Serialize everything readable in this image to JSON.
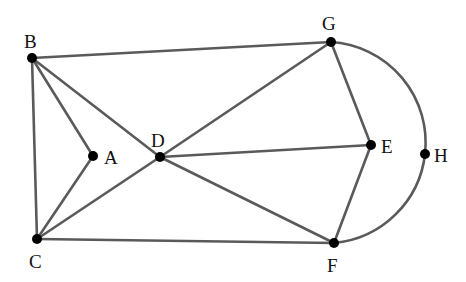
{
  "diagram": {
    "type": "graph",
    "colors": {
      "edge": "#5a5a5a",
      "node": "#000000",
      "label": "#111111",
      "background": "#ffffff"
    },
    "nodes": [
      {
        "id": "A",
        "label": "A",
        "x": 93,
        "y": 156,
        "lx": 104,
        "ly": 164
      },
      {
        "id": "B",
        "label": "B",
        "x": 32,
        "y": 58,
        "lx": 24,
        "ly": 48
      },
      {
        "id": "C",
        "label": "C",
        "x": 37,
        "y": 239,
        "lx": 29,
        "ly": 268
      },
      {
        "id": "D",
        "label": "D",
        "x": 160,
        "y": 157,
        "lx": 151,
        "ly": 147
      },
      {
        "id": "E",
        "label": "E",
        "x": 371,
        "y": 145,
        "lx": 381,
        "ly": 153
      },
      {
        "id": "F",
        "label": "F",
        "x": 334,
        "y": 243,
        "lx": 327,
        "ly": 272
      },
      {
        "id": "G",
        "label": "G",
        "x": 331,
        "y": 42,
        "lx": 322,
        "ly": 30
      },
      {
        "id": "H",
        "label": "H",
        "x": 425,
        "y": 154,
        "lx": 434,
        "ly": 162
      }
    ],
    "edges": [
      [
        "B",
        "G"
      ],
      [
        "B",
        "A"
      ],
      [
        "B",
        "D"
      ],
      [
        "B",
        "C"
      ],
      [
        "A",
        "C"
      ],
      [
        "C",
        "D"
      ],
      [
        "C",
        "F"
      ],
      [
        "D",
        "G"
      ],
      [
        "D",
        "E"
      ],
      [
        "D",
        "F"
      ],
      [
        "G",
        "E"
      ],
      [
        "E",
        "F"
      ]
    ],
    "arcs": [
      {
        "from": "G",
        "via": "H",
        "to": "F"
      }
    ]
  }
}
